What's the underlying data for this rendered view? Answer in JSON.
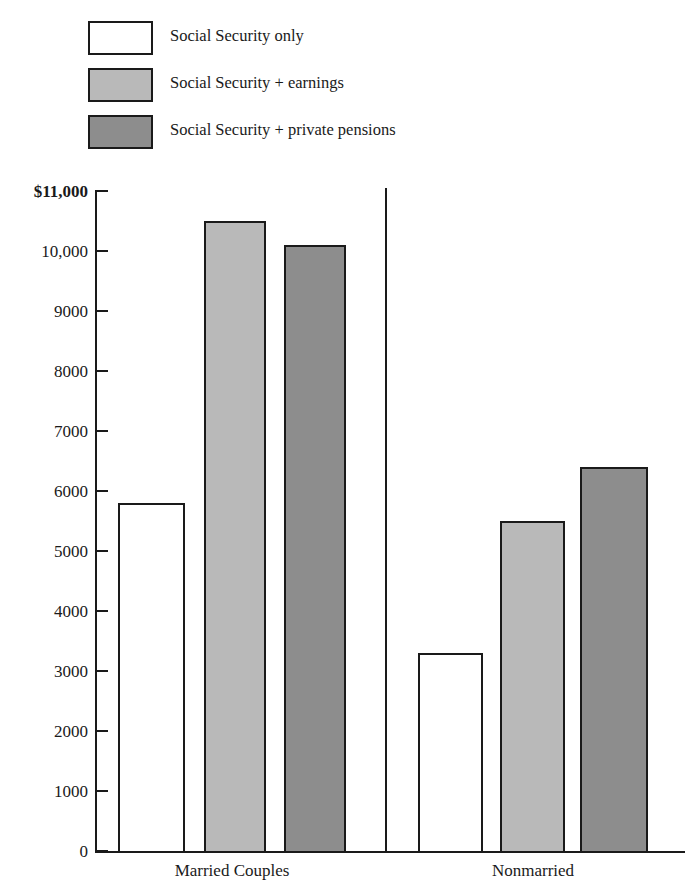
{
  "figure": {
    "clipped_top_text": "",
    "background": "#ffffff"
  },
  "legend": {
    "position": "top-left",
    "items": [
      {
        "label": "Social Security only",
        "swatch": "white",
        "color": "#ffffff"
      },
      {
        "label": "Social Security  +  earnings",
        "swatch": "light",
        "color": "#b9b9b9"
      },
      {
        "label": "Social Security  +  private pensions",
        "swatch": "dark",
        "color": "#8d8d8d"
      }
    ]
  },
  "chart_data": {
    "type": "bar",
    "title": "",
    "xlabel": "",
    "ylabel": "",
    "ylim": [
      0,
      11000
    ],
    "grid": false,
    "legend_position": "top-left",
    "categories": [
      "Married Couples",
      "Nonmarried"
    ],
    "ytick_labels": [
      "$11,000",
      "10,000",
      "9000",
      "8000",
      "7000",
      "6000",
      "5000",
      "4000",
      "3000",
      "2000",
      "1000",
      "0"
    ],
    "ytick_values": [
      11000,
      10000,
      9000,
      8000,
      7000,
      6000,
      5000,
      4000,
      3000,
      2000,
      1000,
      0
    ],
    "series": [
      {
        "name": "Social Security only",
        "color": "#ffffff",
        "values": [
          5800,
          3300
        ]
      },
      {
        "name": "Social Security  +  earnings",
        "color": "#b9b9b9",
        "values": [
          10500,
          5500
        ]
      },
      {
        "name": "Social Security  +  private pensions",
        "color": "#8d8d8d",
        "values": [
          10100,
          6400
        ]
      }
    ]
  }
}
